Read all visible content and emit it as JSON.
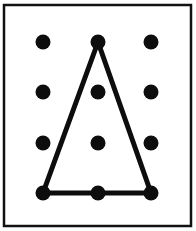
{
  "figure": {
    "canvas": {
      "width": 196,
      "height": 231,
      "background": "#ffffff"
    },
    "frame": {
      "name": "outer-frame",
      "x": 4,
      "y": 5,
      "width": 187,
      "height": 221,
      "stroke": "#111111",
      "stroke_width": 2.5,
      "fill": "#ffffff"
    },
    "grid": {
      "rows": 4,
      "columns": 3,
      "dot_radius": 7.5,
      "dot_color": "#0d0d0d",
      "column_x": [
        43,
        98,
        151
      ],
      "row_y": [
        42,
        92,
        143,
        193
      ],
      "dots": [
        {
          "id": "dot-r1c1",
          "row": 1,
          "col": 1,
          "cx": 43,
          "cy": 42,
          "on_shape": false
        },
        {
          "id": "dot-r1c2",
          "row": 1,
          "col": 2,
          "cx": 98,
          "cy": 42,
          "on_shape": true
        },
        {
          "id": "dot-r1c3",
          "row": 1,
          "col": 3,
          "cx": 151,
          "cy": 42,
          "on_shape": false
        },
        {
          "id": "dot-r2c1",
          "row": 2,
          "col": 1,
          "cx": 43,
          "cy": 92,
          "on_shape": false
        },
        {
          "id": "dot-r2c2",
          "row": 2,
          "col": 2,
          "cx": 98,
          "cy": 92,
          "on_shape": false
        },
        {
          "id": "dot-r2c3",
          "row": 2,
          "col": 3,
          "cx": 151,
          "cy": 92,
          "on_shape": false
        },
        {
          "id": "dot-r3c1",
          "row": 3,
          "col": 1,
          "cx": 43,
          "cy": 143,
          "on_shape": false
        },
        {
          "id": "dot-r3c2",
          "row": 3,
          "col": 2,
          "cx": 98,
          "cy": 143,
          "on_shape": false
        },
        {
          "id": "dot-r3c3",
          "row": 3,
          "col": 3,
          "cx": 151,
          "cy": 143,
          "on_shape": false
        },
        {
          "id": "dot-r4c1",
          "row": 4,
          "col": 1,
          "cx": 43,
          "cy": 193,
          "on_shape": true
        },
        {
          "id": "dot-r4c2",
          "row": 4,
          "col": 2,
          "cx": 98,
          "cy": 193,
          "on_shape": true
        },
        {
          "id": "dot-r4c3",
          "row": 4,
          "col": 3,
          "cx": 151,
          "cy": 193,
          "on_shape": true
        }
      ]
    },
    "shape": {
      "name": "triangle",
      "type": "polygon",
      "stroke": "#0d0d0d",
      "stroke_width": 5,
      "fill": "none",
      "vertices": [
        {
          "id": "apex",
          "dot": "dot-r1c2",
          "x": 98,
          "y": 42
        },
        {
          "id": "bottom-left",
          "dot": "dot-r4c1",
          "x": 43,
          "y": 193
        },
        {
          "id": "bottom-right",
          "dot": "dot-r4c3",
          "x": 151,
          "y": 193
        }
      ],
      "points": "98,42 43,193 151,193",
      "edges": [
        {
          "id": "edge-left",
          "from": "apex",
          "to": "bottom-left"
        },
        {
          "id": "edge-bottom",
          "from": "bottom-left",
          "to": "bottom-right"
        },
        {
          "id": "edge-right",
          "from": "bottom-right",
          "to": "apex"
        }
      ]
    }
  }
}
